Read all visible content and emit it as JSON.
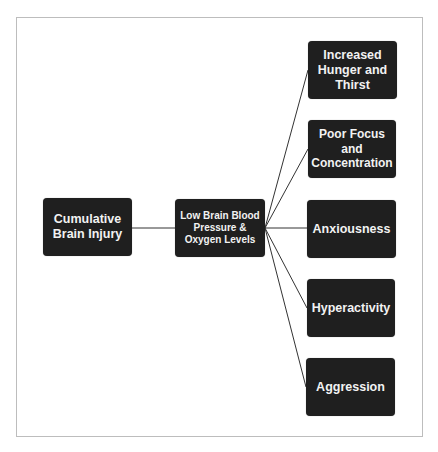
{
  "diagram": {
    "type": "flowchart",
    "colors": {
      "node_fill": "#1f1f1f",
      "node_text": "#f2f2f2",
      "edge": "#333333",
      "frame": "#bdbdbd"
    },
    "nodes": [
      {
        "id": "cause",
        "label": "Cumulative\nBrain Injury"
      },
      {
        "id": "mechanism",
        "label": "Low Brain Blood\nPressure &\nOxygen Levels"
      },
      {
        "id": "effect1",
        "label": "Increased\nHunger and\nThirst"
      },
      {
        "id": "effect2",
        "label": "Poor Focus\nand\nConcentration"
      },
      {
        "id": "effect3",
        "label": "Anxiousness"
      },
      {
        "id": "effect4",
        "label": "Hyperactivity"
      },
      {
        "id": "effect5",
        "label": "Aggression"
      }
    ],
    "edges": [
      {
        "from": "cause",
        "to": "mechanism"
      },
      {
        "from": "mechanism",
        "to": "effect1"
      },
      {
        "from": "mechanism",
        "to": "effect2"
      },
      {
        "from": "mechanism",
        "to": "effect3"
      },
      {
        "from": "mechanism",
        "to": "effect4"
      },
      {
        "from": "mechanism",
        "to": "effect5"
      }
    ]
  }
}
